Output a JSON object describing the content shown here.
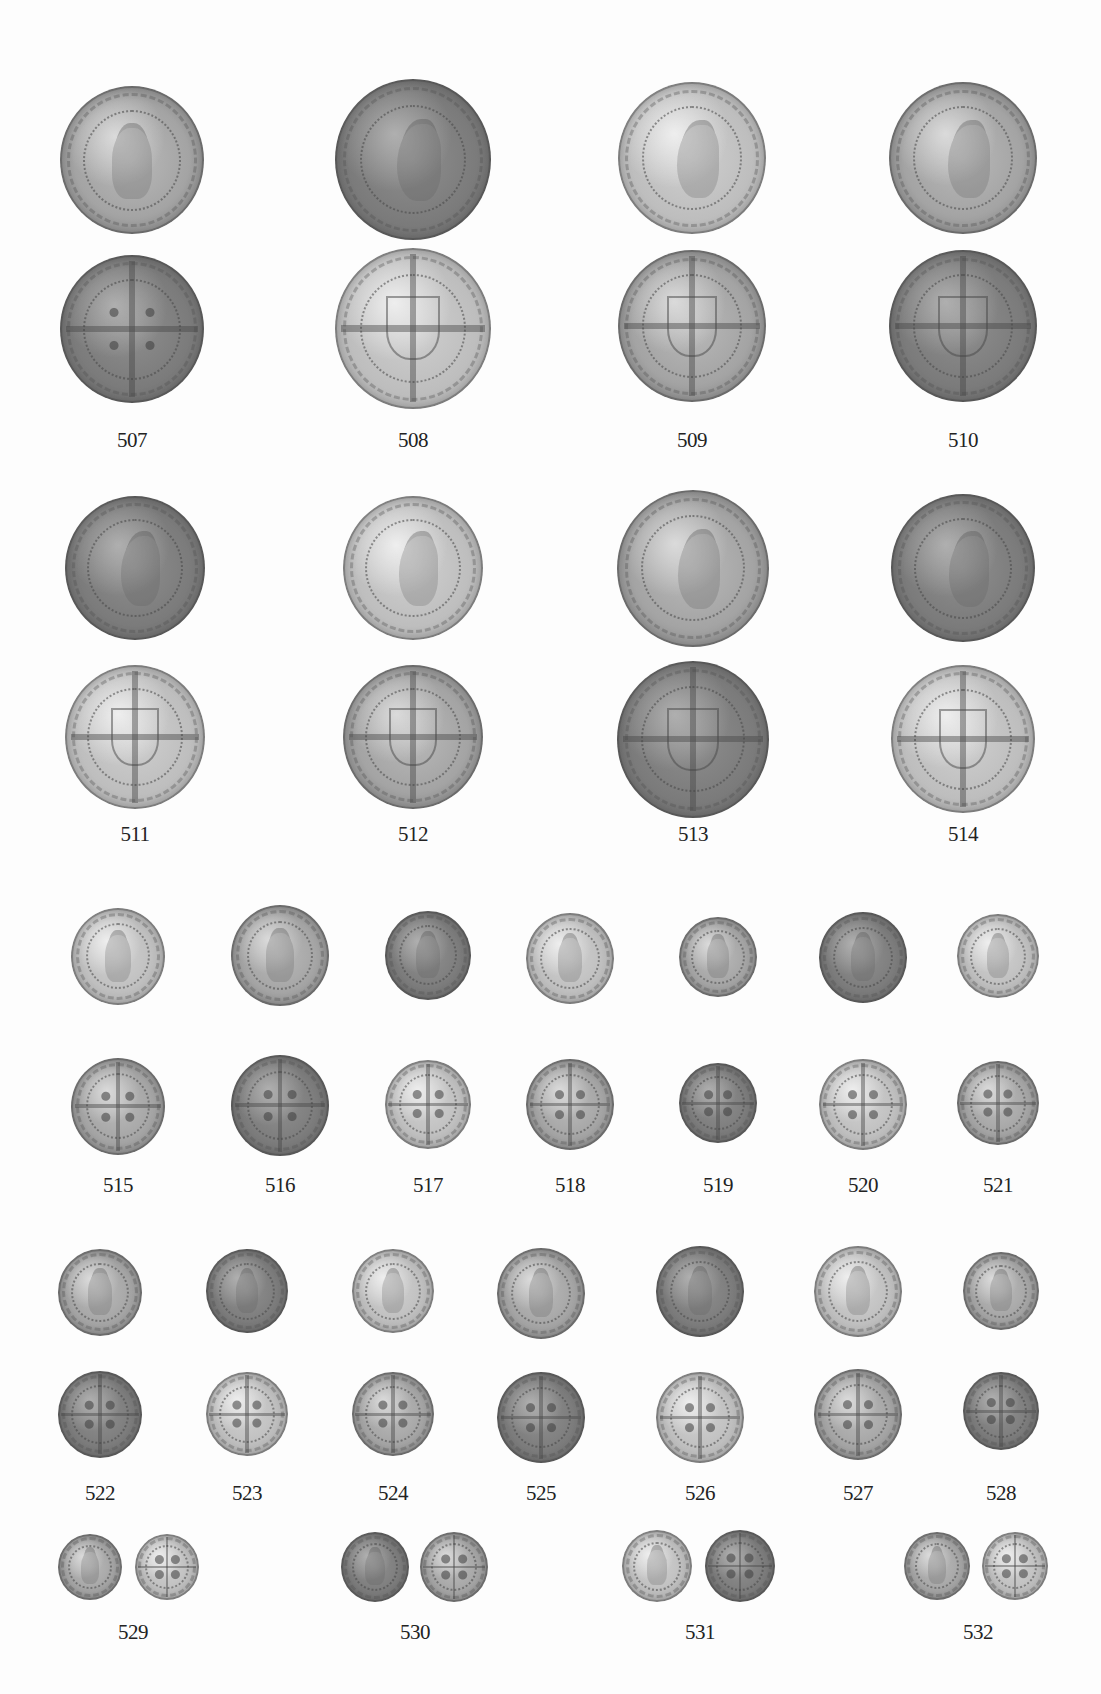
{
  "plate": {
    "background": "#ffffff",
    "coin_color": "#a4a4a4"
  },
  "rows": [
    {
      "id": "row-a",
      "layout": "stacked",
      "items": [
        {
          "number": "507",
          "x": 132,
          "obv_y": 158,
          "rev_y": 327,
          "r": 72,
          "obv": "facing",
          "rev": "pellets",
          "label_y": 428
        },
        {
          "number": "508",
          "x": 413,
          "obv_y": 157,
          "rev_y": 326,
          "r": 78,
          "obv": "profile",
          "rev": "shield",
          "label_y": 428
        },
        {
          "number": "509",
          "x": 692,
          "obv_y": 156,
          "rev_y": 324,
          "r": 74,
          "obv": "profile",
          "rev": "shield",
          "label_y": 428
        },
        {
          "number": "510",
          "x": 963,
          "obv_y": 156,
          "rev_y": 324,
          "r": 74,
          "obv": "profile",
          "rev": "shield",
          "label_y": 428
        }
      ]
    },
    {
      "id": "row-b",
      "layout": "stacked",
      "items": [
        {
          "number": "511",
          "x": 135,
          "obv_y": 566,
          "rev_y": 735,
          "r": 70,
          "obv": "profile",
          "rev": "shield",
          "label_y": 822
        },
        {
          "number": "512",
          "x": 413,
          "obv_y": 566,
          "rev_y": 735,
          "r": 70,
          "obv": "profile",
          "rev": "shield",
          "label_y": 822
        },
        {
          "number": "513",
          "x": 693,
          "obv_y": 566,
          "rev_y": 737,
          "r": 76,
          "obv": "profile",
          "rev": "shield",
          "label_y": 822
        },
        {
          "number": "514",
          "x": 963,
          "obv_y": 566,
          "rev_y": 737,
          "r": 72,
          "obv": "profile",
          "rev": "shield",
          "label_y": 822
        }
      ]
    },
    {
      "id": "row-c",
      "layout": "stacked",
      "items": [
        {
          "number": "515",
          "x": 118,
          "obv_y": 955,
          "rev_y": 1105,
          "r": 47,
          "obv": "facing",
          "rev": "pellets",
          "label_y": 1173
        },
        {
          "number": "516",
          "x": 280,
          "obv_y": 954,
          "rev_y": 1104,
          "r": 49,
          "obv": "facing",
          "rev": "pellets",
          "label_y": 1173
        },
        {
          "number": "517",
          "x": 428,
          "obv_y": 954,
          "rev_y": 1103,
          "r": 43,
          "obv": "facing",
          "rev": "pellets",
          "label_y": 1173
        },
        {
          "number": "518",
          "x": 570,
          "obv_y": 957,
          "rev_y": 1103,
          "r": 44,
          "obv": "facing",
          "rev": "pellets",
          "label_y": 1173
        },
        {
          "number": "519",
          "x": 718,
          "obv_y": 956,
          "rev_y": 1102,
          "r": 39,
          "obv": "facing",
          "rev": "pellets",
          "label_y": 1173
        },
        {
          "number": "520",
          "x": 863,
          "obv_y": 956,
          "rev_y": 1103,
          "r": 44,
          "obv": "facing",
          "rev": "pellets",
          "label_y": 1173
        },
        {
          "number": "521",
          "x": 998,
          "obv_y": 955,
          "rev_y": 1102,
          "r": 41,
          "obv": "facing",
          "rev": "pellets",
          "label_y": 1173
        }
      ]
    },
    {
      "id": "row-d",
      "layout": "stacked",
      "items": [
        {
          "number": "522",
          "x": 100,
          "obv_y": 1291,
          "rev_y": 1413,
          "r": 42,
          "obv": "facing",
          "rev": "pellets",
          "label_y": 1481
        },
        {
          "number": "523",
          "x": 247,
          "obv_y": 1290,
          "rev_y": 1413,
          "r": 41,
          "obv": "facing",
          "rev": "pellets",
          "label_y": 1481
        },
        {
          "number": "524",
          "x": 393,
          "obv_y": 1290,
          "rev_y": 1413,
          "r": 41,
          "obv": "facing",
          "rev": "pellets",
          "label_y": 1481
        },
        {
          "number": "525",
          "x": 541,
          "obv_y": 1292,
          "rev_y": 1416,
          "r": 44,
          "obv": "facing",
          "rev": "pellets",
          "label_y": 1481
        },
        {
          "number": "526",
          "x": 700,
          "obv_y": 1290,
          "rev_y": 1416,
          "r": 44,
          "obv": "facing",
          "rev": "pellets",
          "label_y": 1481
        },
        {
          "number": "527",
          "x": 858,
          "obv_y": 1290,
          "rev_y": 1413,
          "r": 44,
          "obv": "facing",
          "rev": "pellets",
          "label_y": 1481
        },
        {
          "number": "528",
          "x": 1001,
          "obv_y": 1290,
          "rev_y": 1410,
          "r": 38,
          "obv": "facing",
          "rev": "pellets",
          "label_y": 1481
        }
      ]
    },
    {
      "id": "row-e",
      "layout": "paired",
      "items": [
        {
          "number": "529",
          "obv_x": 90,
          "rev_x": 167,
          "y": 1566,
          "r": 32,
          "obv": "facing",
          "rev": "pellets",
          "label_x": 133,
          "label_y": 1620
        },
        {
          "number": "530",
          "obv_x": 375,
          "rev_x": 454,
          "y": 1566,
          "r": 34,
          "obv": "facing",
          "rev": "pellets",
          "label_x": 415,
          "label_y": 1620
        },
        {
          "number": "531",
          "obv_x": 657,
          "rev_x": 740,
          "y": 1565,
          "r": 35,
          "obv": "facing",
          "rev": "pellets",
          "label_x": 700,
          "label_y": 1620
        },
        {
          "number": "532",
          "obv_x": 937,
          "rev_x": 1015,
          "y": 1565,
          "r": 33,
          "obv": "portcullis",
          "rev": "pellets",
          "label_x": 978,
          "label_y": 1620
        }
      ]
    }
  ]
}
